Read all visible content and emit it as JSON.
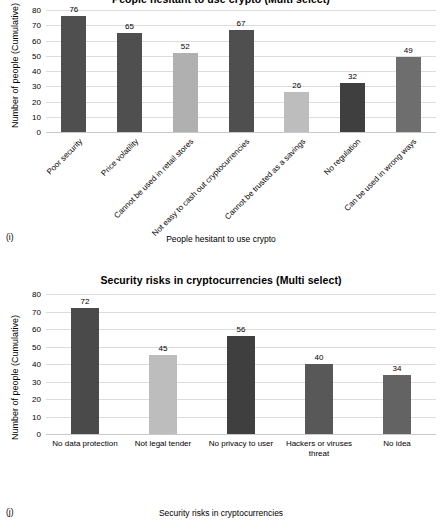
{
  "chart_data": [
    {
      "id": "i",
      "panel_letter": "(i)",
      "type": "bar",
      "title": "People hesitant to use crypto (Multi select)",
      "title_truncated": true,
      "xlabel": "People hesitant to use crypto",
      "ylabel": "Number of people (Cumulative)",
      "ylim": [
        0,
        80
      ],
      "yticks": [
        0,
        10,
        20,
        30,
        40,
        50,
        60,
        70,
        80
      ],
      "grid": true,
      "legend": "none",
      "categories": [
        "Poor security",
        "Price volatility",
        "Cannot be used in retail stores",
        "Not easy to cash out cryptocurrencies",
        "Cannot be trusted as a savings",
        "No regulation",
        "Can be used in wrong ways"
      ],
      "values": [
        76,
        65,
        52,
        67,
        26,
        32,
        49
      ],
      "bar_colors": [
        "#4f4f4f",
        "#4f4f4f",
        "#b0b0b0",
        "#4f4f4f",
        "#bdbdbd",
        "#3f3f3f",
        "#6e6e6e"
      ]
    },
    {
      "id": "j",
      "panel_letter": "(j)",
      "type": "bar",
      "title": "Security risks in cryptocurrencies (Multi select)",
      "xlabel": "Security risks in cryptocurrencies",
      "ylabel": "Number of people (Cumulative)",
      "ylim": [
        0,
        80
      ],
      "yticks": [
        0,
        10,
        20,
        30,
        40,
        50,
        60,
        70,
        80
      ],
      "grid": true,
      "legend": "none",
      "categories": [
        "No data protection",
        "Not legal tender",
        "No privacy to  user",
        "Hackers or viruses threat",
        "No idea"
      ],
      "values": [
        72,
        45,
        56,
        40,
        34
      ],
      "bar_colors": [
        "#4a4a4a",
        "#bdbdbd",
        "#3f3f3f",
        "#585858",
        "#636363"
      ]
    }
  ]
}
